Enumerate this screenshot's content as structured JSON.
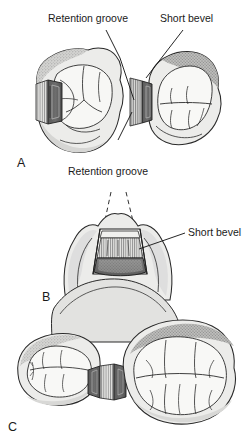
{
  "figure": {
    "background_color": "#ffffff",
    "ink_color": "#1a1a1a",
    "enamel_fill": "#f2f2f0",
    "dentin_shade": "#d8d8d6",
    "dark_shade": "#6a6a6a",
    "mid_shade": "#9a9a9a",
    "hatch_shade": "#b5b5b5"
  },
  "panels": [
    {
      "id": "A",
      "letter": "A",
      "caption_labels": [
        {
          "key": "retention_groove_top",
          "text": "Retention groove"
        },
        {
          "key": "short_bevel_top",
          "text": "Short bevel"
        },
        {
          "key": "retention_groove_bottom",
          "text": "Retention groove"
        }
      ],
      "view": "occlusal view of two adjacent molars with proximal box preparation"
    },
    {
      "id": "B",
      "letter": "B",
      "caption_labels": [
        {
          "key": "short_bevel_mid",
          "text": "Short bevel"
        }
      ],
      "view": "proximal view of preparation with divergent walls shown by dashed lines"
    },
    {
      "id": "C",
      "letter": "C",
      "caption_labels": [],
      "view": "occlusal view of two adjacent molars with completed preparation"
    }
  ],
  "labels": {
    "retention_groove_top": "Retention groove",
    "short_bevel_top": "Short bevel",
    "retention_groove_bottom": "Retention groove",
    "short_bevel_mid": "Short bevel",
    "letter_a": "A",
    "letter_b": "B",
    "letter_c": "C"
  }
}
